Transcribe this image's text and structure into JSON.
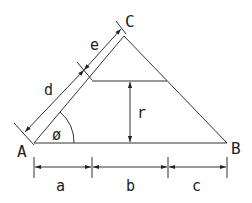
{
  "diagram": {
    "vertices": {
      "A": "A",
      "B": "B",
      "C": "C"
    },
    "dimensions": {
      "a": "a",
      "b": "b",
      "c": "c",
      "d": "d",
      "e": "e",
      "r": "r"
    },
    "angle": "ø",
    "line_color": "#333333"
  }
}
